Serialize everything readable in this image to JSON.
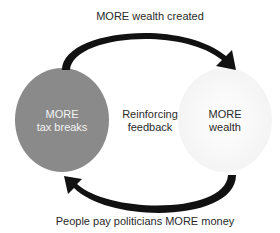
{
  "diagram": {
    "type": "reinforcing feedback loop",
    "nodes": [
      {
        "id": "tax_breaks",
        "line1": "MORE",
        "line2": "tax breaks",
        "fill": "#8a8a8a",
        "text_color": "#f4f4f4"
      },
      {
        "id": "wealth",
        "line1": "MORE",
        "line2": "wealth",
        "fill": "#fbfbfb",
        "text_color": "#2a2a2a"
      }
    ],
    "center": {
      "line1": "Reinforcing",
      "line2": "feedback"
    },
    "edges": [
      {
        "from": "tax_breaks",
        "to": "wealth",
        "label": "MORE wealth created",
        "position": "top"
      },
      {
        "from": "wealth",
        "to": "tax_breaks",
        "label": "People pay politicians MORE money",
        "position": "bottom"
      }
    ],
    "colors": {
      "arrow": "#111111",
      "text": "#2a2a2a",
      "background": "#ffffff"
    }
  }
}
